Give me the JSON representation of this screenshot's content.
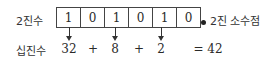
{
  "labels": {
    "binary": "2진수",
    "decimal": "십진수",
    "binary_point": "2진 소수점"
  },
  "binary_digits": [
    "1",
    "0",
    "1",
    "0",
    "1",
    "0"
  ],
  "decimal_terms": {
    "t1": "32",
    "op1": "+",
    "t2": "8",
    "op2": "+",
    "t3": "2",
    "result": "= 42"
  },
  "arrows_from_cells": [
    0,
    2,
    4
  ]
}
